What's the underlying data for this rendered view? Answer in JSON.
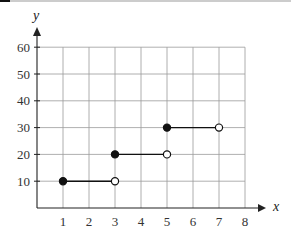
{
  "chart_data": {
    "type": "line",
    "subtype": "step-function",
    "title": "",
    "xlabel": "x",
    "ylabel": "y",
    "xlim": [
      0,
      8
    ],
    "ylim": [
      0,
      60
    ],
    "x_ticks": [
      1,
      2,
      3,
      4,
      5,
      6,
      7,
      8
    ],
    "y_ticks": [
      10,
      20,
      30,
      40,
      50,
      60
    ],
    "grid": true,
    "legend": null,
    "segments": [
      {
        "x_start": 1,
        "x_end": 3,
        "y": 10,
        "start_closed": true,
        "end_closed": false
      },
      {
        "x_start": 3,
        "x_end": 5,
        "y": 20,
        "start_closed": true,
        "end_closed": false
      },
      {
        "x_start": 5,
        "x_end": 7,
        "y": 30,
        "start_closed": true,
        "end_closed": false
      }
    ]
  },
  "colors": {
    "grid": "#9a9a9a",
    "axis": "#222222",
    "line": "#111111",
    "top_rule": "#bbbbbb"
  }
}
